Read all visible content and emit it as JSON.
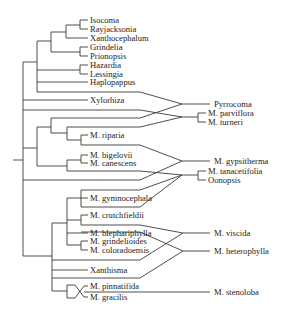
{
  "diagram": {
    "type": "phylogenetic-tree-reticulate",
    "taxa": {
      "isocoma": "Isocoma",
      "rayjacksonia": "Rayjacksonia",
      "xanthocephalum": "Xanthocephalum",
      "grindelia": "Grindelia",
      "prionopsis": "Prionopsis",
      "hazardia": "Hazardia",
      "lessingia": "Lessingia",
      "haplopappus": "Haplopappus",
      "xylorhiza": "Xylorhiza",
      "riparia": "M. riparia",
      "bigelovii": "M. bigelovii",
      "canescens": "M. canescens",
      "gymnocephala": "M. gymnocephala",
      "crutchfieldii": "M. crutchfieldii",
      "blephariphylla": "M. blephariphylla",
      "grindelioides": "M. grindelioides",
      "coloradoensis": "M. coloradoensis",
      "xanthisma": "Xanthisma",
      "pinnatifida": "M. pinnatifida",
      "gracilis": "M. gracilis"
    },
    "hybrids": {
      "pyrrocoma": "Pyrrocoma",
      "parviflora": "M. parviflora",
      "turneri": "M. turneri",
      "gypsitherma": "M. gypsitherma",
      "tanacetifolia": "M. tanacetifolia",
      "oonopsis": "Oonopsis",
      "viscida": "M. viscida",
      "heterophylla": "M. heterophylla",
      "stenoloba": "M. stenoloba"
    },
    "line_color": "#3a3a3a"
  }
}
